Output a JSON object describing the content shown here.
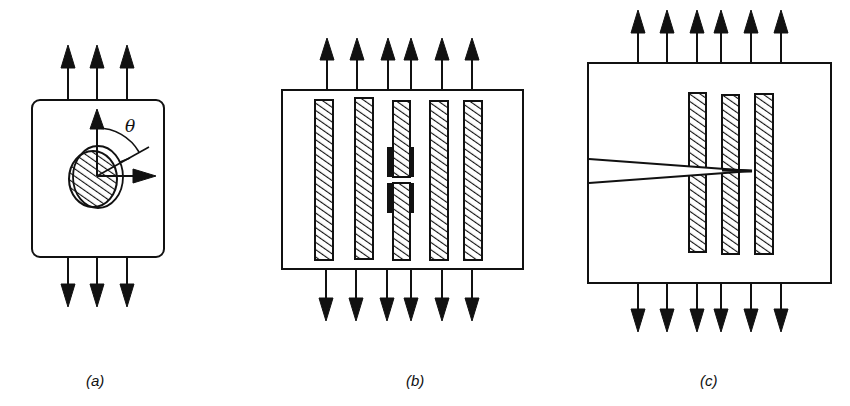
{
  "figure": {
    "colors": {
      "ink": "#111111",
      "background": "#ffffff"
    },
    "panels": [
      {
        "id": "a",
        "label": "(a)",
        "description": "Plate under uniaxial tension with an inclined elliptical hatched inclusion",
        "angle_symbol": "θ",
        "box": {
          "x": 32,
          "y": 100,
          "w": 132,
          "h": 157,
          "rounded": true
        },
        "arrows_x": [
          68,
          97,
          127
        ]
      },
      {
        "id": "b",
        "label": "(b)",
        "description": "Plate under tension with five aligned fibres; the middle fibre is broken",
        "box": {
          "x": 282,
          "y": 90,
          "w": 241,
          "h": 179
        },
        "arrows_x": [
          327,
          357,
          388,
          411,
          442,
          472
        ],
        "fiber_count": 5
      },
      {
        "id": "c",
        "label": "(c)",
        "description": "Plate under tension with three fibres and a matrix crack bridged by fibres",
        "box": {
          "x": 588,
          "y": 63,
          "w": 243,
          "h": 220
        },
        "arrows_x": [
          638,
          667,
          697,
          721,
          751,
          781
        ],
        "fiber_count": 3
      }
    ]
  }
}
